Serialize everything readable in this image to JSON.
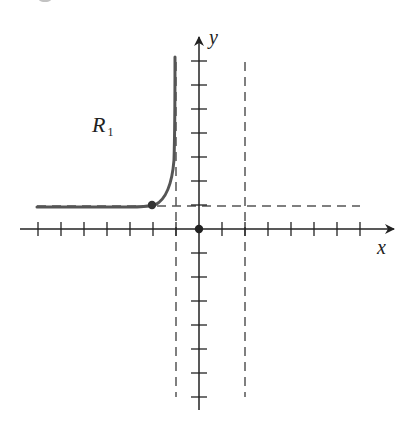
{
  "figure": {
    "cropped_caption_fragment": "g"
  },
  "axes": {
    "x_label": "x",
    "y_label": "y",
    "origin_px": [
      199,
      229
    ],
    "unit_px_x": 23,
    "unit_px_y": 24,
    "x_ticks": [
      -7,
      -6,
      -5,
      -4,
      -3,
      -2,
      -1,
      1,
      2,
      3,
      4,
      5,
      6,
      7
    ],
    "y_ticks": [
      -7,
      -6,
      -5,
      -4,
      -3,
      -2,
      -1,
      1,
      2,
      3,
      4,
      5,
      6,
      7
    ],
    "tick_labels_shown": false
  },
  "region_label": {
    "main": "R",
    "subscript": "1"
  },
  "colors": {
    "axis": "#222222",
    "curve": "#555555",
    "dashed": "#555555",
    "point": "#333333"
  },
  "chart_data": {
    "type": "line",
    "title": "",
    "xlabel": "x",
    "ylabel": "y",
    "xlim": [
      -7.5,
      8.3
    ],
    "ylim": [
      -7.5,
      7.7
    ],
    "grid": false,
    "legend": [],
    "annotations": [
      "R1"
    ],
    "asymptotes": {
      "vertical": [
        -1,
        2
      ],
      "horizontal": [
        1
      ]
    },
    "series": [
      {
        "name": "R1",
        "description": "branch left of x=-1, approaching y=1 as x→-∞ and rising to +∞ as x→-1⁻",
        "x": [
          -7,
          -6,
          -5,
          -4,
          -3,
          -2,
          -1.6,
          -1.3,
          -1.15,
          -1.05
        ],
        "y": [
          1.0,
          1.0,
          1.0,
          1.0,
          1.02,
          1.05,
          1.3,
          2.2,
          4.0,
          7.4
        ]
      }
    ],
    "points": [
      {
        "x": -2,
        "y": 1,
        "style": "filled"
      },
      {
        "x": 0,
        "y": 0,
        "style": "filled"
      }
    ]
  }
}
